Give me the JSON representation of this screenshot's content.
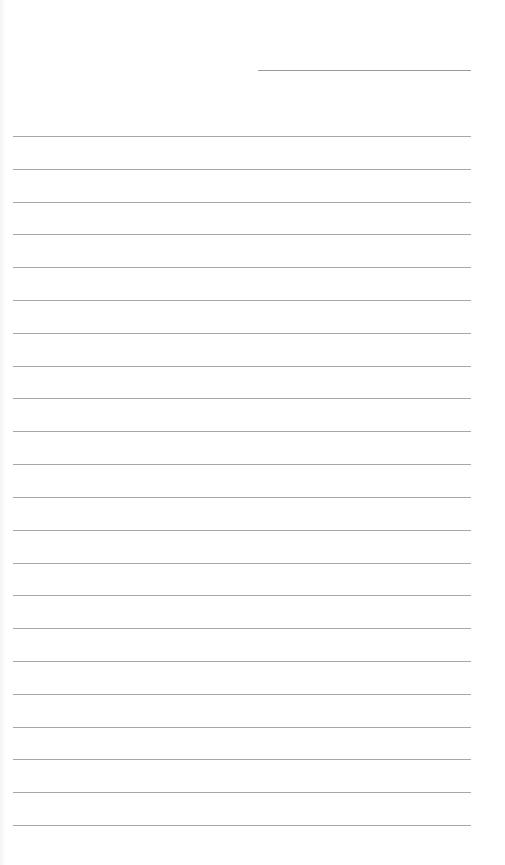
{
  "page": {
    "type": "lined-paper",
    "line_color": "#a8a8a8",
    "background_color": "#ffffff",
    "header_line_count": 1,
    "ruled_line_count": 22
  }
}
